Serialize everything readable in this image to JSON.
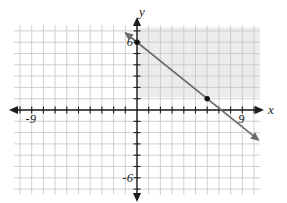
{
  "figure": {
    "background": "#ffffff",
    "grid_color": "#c9c9c9",
    "axis_color": "#1c1c1c",
    "line_color": "#6d6d6d",
    "point_color": "#101010",
    "shade_color": "#ececec"
  },
  "chart_data": {
    "type": "line",
    "title": "",
    "xlabel": "x",
    "ylabel": "y",
    "xlim": [
      -10.5,
      10.5
    ],
    "ylim": [
      -7.5,
      7.5
    ],
    "grid": true,
    "x_gridline_range": [
      -10,
      10
    ],
    "y_gridline_range": [
      -7,
      7
    ],
    "x_tick_range": [
      -10,
      10
    ],
    "y_tick_range": [
      -7,
      7
    ],
    "tick_step": 1,
    "axis_tick_labels": [
      {
        "axis": "x",
        "value": -9,
        "label": "-9"
      },
      {
        "axis": "x",
        "value": 9,
        "label": "9"
      },
      {
        "axis": "y",
        "value": 6,
        "label": "6"
      },
      {
        "axis": "y",
        "value": -6,
        "label": "-6"
      }
    ],
    "series": [
      {
        "name": "line-1",
        "equation": "y = -(5/6)x + 6",
        "slope": -0.83333,
        "intercept": 6,
        "x_intercept": 7.2,
        "draw_x_range": [
          -0.95,
          10.35
        ],
        "arrow_ends": "both",
        "points_marked": [
          [
            0,
            6
          ],
          [
            6,
            1
          ]
        ]
      }
    ],
    "shaded_region": {
      "x_range": [
        0,
        10.5
      ],
      "y_range": [
        1.15,
        7.3
      ]
    }
  }
}
